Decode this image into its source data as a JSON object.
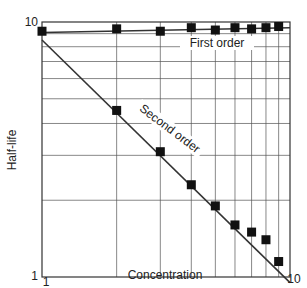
{
  "chart_data": {
    "type": "scatter",
    "title": "",
    "xlabel": "Concentration",
    "ylabel": "Half-life",
    "xscale": "log",
    "yscale": "log",
    "xlim": [
      1,
      10
    ],
    "ylim": [
      1,
      10
    ],
    "x_tick_labels": [
      "1",
      "10"
    ],
    "y_tick_labels": [
      "1",
      "10"
    ],
    "grid": true,
    "series": [
      {
        "name": "First order",
        "x": [
          1,
          2,
          3,
          4,
          5,
          6,
          7,
          8,
          9
        ],
        "values": [
          9.2,
          9.4,
          9.2,
          9.5,
          9.3,
          9.5,
          9.4,
          9.5,
          9.6
        ],
        "fit_line": {
          "from": [
            1,
            9.1
          ],
          "to": [
            10,
            9.5
          ]
        }
      },
      {
        "name": "Second order",
        "x": [
          2,
          3,
          4,
          5,
          6,
          7,
          8,
          9
        ],
        "values": [
          4.5,
          3.1,
          2.3,
          1.9,
          1.6,
          1.5,
          1.4,
          1.15
        ],
        "fit_line": {
          "from": [
            1,
            8.5
          ],
          "to": [
            10,
            0.95
          ]
        }
      }
    ],
    "annotations": [
      "First order",
      "Second order"
    ]
  }
}
